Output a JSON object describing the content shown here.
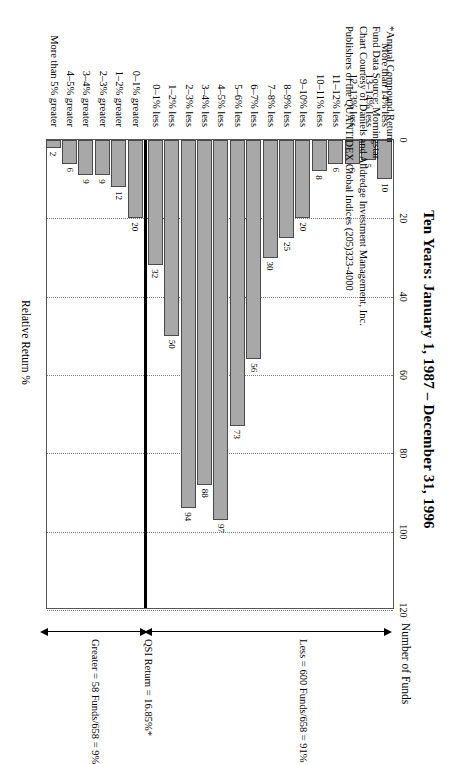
{
  "chart_data": {
    "type": "bar",
    "orientation": "horizontal",
    "title": "Ten Years: January 1, 1987 – December 31, 1996",
    "xlabel": "Number of Funds",
    "ylabel": "Relative Return %",
    "xlim": [
      0,
      120
    ],
    "xticks": [
      "0",
      "20",
      "40",
      "60",
      "80",
      "100",
      "120"
    ],
    "grid": true,
    "legend": "none",
    "categories": [
      "More than 14% less",
      "13–14% less",
      "12–13% less",
      "11–12% less",
      "10–11% less",
      "9–10% less",
      "8–9% less",
      "7–8% less",
      "6–7% less",
      "5–6% less",
      "4–5% less",
      "3–4% less",
      "2–3% less",
      "1–2% less",
      "0–1% less",
      "0–1% greater",
      "1–2% greater",
      "2–3% greater",
      "3–4% greater",
      "4–5% greater",
      "More than 5% greater"
    ],
    "values": [
      10,
      5,
      6,
      6,
      8,
      20,
      25,
      30,
      56,
      73,
      97,
      88,
      94,
      50,
      32,
      20,
      12,
      9,
      9,
      6,
      2
    ],
    "zero_divider_after_index": 14,
    "annotations": [
      "Less = 600 Funds/658 = 91%",
      "QSI Return = 16.85%*",
      "Greater = 58 Funds/658 = 9%"
    ]
  },
  "chart": {
    "title": "Ten Years: January 1, 1987 – December 31, 1996",
    "axis_label_x": "Number of Funds",
    "axis_label_y": "Relative Return %",
    "ticks": [
      "0",
      "20",
      "40",
      "60",
      "80",
      "100",
      "120"
    ],
    "bars": [
      {
        "label": "More than 14% less",
        "value": 10
      },
      {
        "label": "13–14% less",
        "value": 5
      },
      {
        "label": "12–13% less",
        "value": 6
      },
      {
        "label": "11–12% less",
        "value": 6
      },
      {
        "label": "10–11% less",
        "value": 8
      },
      {
        "label": "9–10% less",
        "value": 20
      },
      {
        "label": "8–9% less",
        "value": 25
      },
      {
        "label": "7–8% less",
        "value": 30
      },
      {
        "label": "6–7% less",
        "value": 56
      },
      {
        "label": "5–6% less",
        "value": 73
      },
      {
        "label": "4–5% less",
        "value": 97
      },
      {
        "label": "3–4% less",
        "value": 88
      },
      {
        "label": "2–3% less",
        "value": 94
      },
      {
        "label": "1–2% less",
        "value": 50
      },
      {
        "label": "0–1% less",
        "value": 32
      },
      {
        "label": "0–1% greater",
        "value": 20
      },
      {
        "label": "1–2% greater",
        "value": 12
      },
      {
        "label": "2–3% greater",
        "value": 9
      },
      {
        "label": "3–4% greater",
        "value": 9
      },
      {
        "label": "4–5% greater",
        "value": 6
      },
      {
        "label": "More than 5% greater",
        "value": 2
      }
    ],
    "annotation_less": "Less = 600 Funds/658 = 91%",
    "annotation_qsi": "QSI Return = 16.85%*",
    "annotation_greater": "Greater = 58 Funds/658 = 9%",
    "bar_fill_color": "#a8a8a8",
    "bar_stroke_color": "#4a4a4a",
    "gridline_color": "#7a7a9a"
  },
  "footnote": {
    "line1": "*Annual Compound Return",
    "line2": "Fund Data Source: Morningstar",
    "line3": "Chart Courtesy of Daniels and Alldredge Investment Management, Inc.",
    "line4": "Publishers of the QUANTIDEX Global Indices (205)323-4000"
  }
}
